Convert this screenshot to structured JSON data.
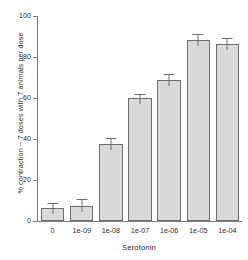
{
  "chart_data": {
    "type": "bar",
    "title": "",
    "subtitle": "",
    "xlabel": "Serotonin",
    "ylabel": "% contraction ~ 7 doses with 7 animals per dose",
    "categories": [
      "0",
      "1e-09",
      "1e-08",
      "1e-07",
      "1e-06",
      "1e-05",
      "1e-04"
    ],
    "values": [
      6.3,
      7.5,
      37.5,
      60.0,
      69.0,
      88.5,
      86.5
    ],
    "errors": [
      2.2,
      2.6,
      2.3,
      1.6,
      2.2,
      2.2,
      2.2
    ],
    "ylim": [
      0,
      100
    ],
    "yticks": [
      0,
      20,
      40,
      60,
      80,
      100
    ],
    "ytick_labels": [
      "0",
      "20",
      "40",
      "60",
      "80",
      "100"
    ],
    "grid": false,
    "legend": "none",
    "bar_fill_color": "#d9d9d9",
    "bar_border_color": "#6e6e6e",
    "axis_color": "#7d7d7d",
    "text_color": "#2b2b2b",
    "background_color": "#ffffff"
  }
}
